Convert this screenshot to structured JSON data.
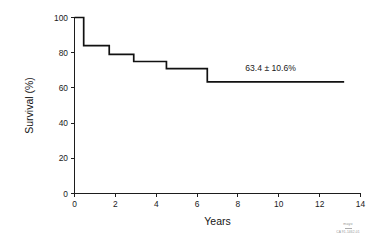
{
  "chart_data": {
    "type": "line",
    "subtype": "kaplan-meier-step",
    "title": "",
    "subtitle": "",
    "xlabel": "Years",
    "ylabel": "Survival (%)",
    "xlim": [
      0,
      14
    ],
    "ylim": [
      0,
      100
    ],
    "xticks": [
      0,
      2,
      4,
      6,
      8,
      10,
      12,
      14
    ],
    "yticks": [
      0,
      20,
      40,
      60,
      80,
      100
    ],
    "xtick_labels": [
      "0",
      "2",
      "4",
      "6",
      "8",
      "10",
      "12",
      "14"
    ],
    "ytick_labels": [
      "0",
      "20",
      "40",
      "60",
      "80",
      "100"
    ],
    "grid": false,
    "legend": false,
    "legend_position": "none",
    "series": [
      {
        "name": "Overall survival",
        "step": "post",
        "color": "#111111",
        "x": [
          0.0,
          0.45,
          0.45,
          1.7,
          1.7,
          2.9,
          2.9,
          4.5,
          4.5,
          6.5,
          6.5,
          13.2
        ],
        "y": [
          100.0,
          100.0,
          84.0,
          84.0,
          79.0,
          79.0,
          75.0,
          75.0,
          71.0,
          71.0,
          63.4,
          63.4
        ]
      }
    ],
    "annotations": [
      {
        "text": "63.4 ± 10.6%",
        "x": 9.6,
        "y": 69.5,
        "value": 63.4,
        "error": 10.6,
        "unit": "%"
      }
    ]
  },
  "watermark": {
    "name": "mayo",
    "code": "CA 91-1462-01"
  }
}
